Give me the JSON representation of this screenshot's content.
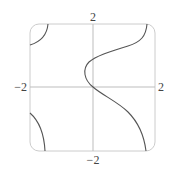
{
  "plot": {
    "labels": {
      "y_max": "2",
      "y_min": "−2",
      "x_min": "−2",
      "x_max": "2"
    },
    "range": {
      "x": [
        -2,
        2
      ],
      "y": [
        -2,
        2
      ]
    },
    "colors": {
      "frame": "#c8c8c8",
      "axes": "#bdbdbd",
      "curve": "#555555",
      "text": "#444444"
    }
  }
}
